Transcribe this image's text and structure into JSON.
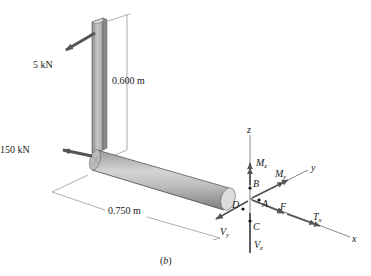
{
  "figure": {
    "caption": "(b)",
    "loads": {
      "force_top": "5 kN",
      "force_side": "150 kN"
    },
    "dimensions": {
      "height": "0.600 m",
      "length": "0.750 m"
    },
    "axes": {
      "x": "x",
      "y": "y",
      "z": "z"
    },
    "points": {
      "A": "A",
      "B": "B",
      "C": "C",
      "D": "D"
    },
    "internal_loads": {
      "Mz_main": "M",
      "Mz_sub": "z",
      "My_main": "M",
      "My_sub": "y",
      "F": "F",
      "Tx_main": "T",
      "Tx_sub": "x",
      "Vy_main": "V",
      "Vy_sub": "y",
      "Vz_main": "V",
      "Vz_sub": "z"
    }
  }
}
